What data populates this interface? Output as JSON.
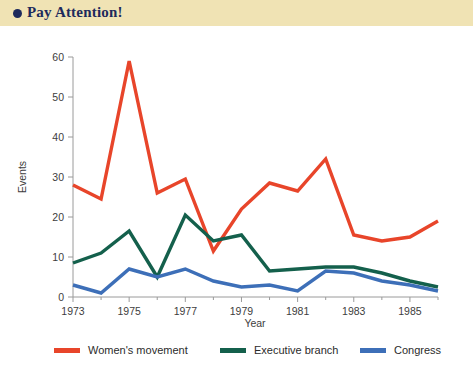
{
  "header": {
    "bullet_icon": "circle-bullet-icon",
    "title": "Pay Attention!",
    "background_color": "#f0e3b4",
    "text_color": "#1d2a5c"
  },
  "legend": {
    "position": "bottom",
    "items": [
      {
        "label": "Women's movement",
        "color": "#e8452a"
      },
      {
        "label": "Executive branch",
        "color": "#14604c"
      },
      {
        "label": "Congress",
        "color": "#3d6fb8"
      }
    ]
  },
  "axes": {
    "x_title": "Year",
    "y_title": "Events",
    "x_tick_labels": [
      "1973",
      "1975",
      "1977",
      "1979",
      "1981",
      "1983",
      "1985"
    ],
    "y_tick_labels": [
      "0",
      "10",
      "20",
      "30",
      "40",
      "50",
      "60"
    ]
  },
  "chart_data": {
    "type": "line",
    "title": "Pay Attention!",
    "xlabel": "Year",
    "ylabel": "Events",
    "xlim": [
      1973,
      1986
    ],
    "ylim": [
      0,
      60
    ],
    "xticks": [
      1973,
      1975,
      1977,
      1979,
      1981,
      1983,
      1985
    ],
    "yticks": [
      0,
      10,
      20,
      30,
      40,
      50,
      60
    ],
    "grid": false,
    "legend_position": "bottom",
    "x": [
      1973,
      1974,
      1975,
      1976,
      1977,
      1978,
      1979,
      1980,
      1981,
      1982,
      1983,
      1984,
      1985,
      1986
    ],
    "series": [
      {
        "name": "Women's movement",
        "color": "#e8452a",
        "values": [
          28,
          24.5,
          59,
          26,
          29.5,
          11.5,
          22,
          28.5,
          26.5,
          34.5,
          15.5,
          14,
          15,
          19
        ]
      },
      {
        "name": "Executive branch",
        "color": "#14604c",
        "values": [
          8.5,
          11,
          16.5,
          5,
          20.5,
          14,
          15.5,
          6.5,
          7,
          7.5,
          7.5,
          6,
          4,
          2.5
        ]
      },
      {
        "name": "Congress",
        "color": "#3d6fb8",
        "values": [
          3,
          1,
          7,
          5,
          7,
          4,
          2.5,
          3,
          1.5,
          6.5,
          6,
          4,
          3,
          1.5
        ]
      }
    ]
  }
}
